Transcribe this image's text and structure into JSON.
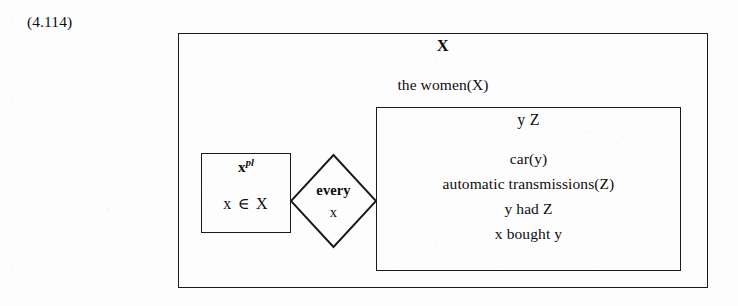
{
  "figure": {
    "equation_label": "(4.114)",
    "type": "discourse-representation-structure"
  },
  "outer_box": {
    "universe": "X",
    "condition": "the women(X)"
  },
  "antecedent_box": {
    "universe_base": "x",
    "universe_superscript": "pl",
    "condition": "x ∈ X"
  },
  "quantifier_diamond": {
    "quantifier": "every",
    "variable": "x"
  },
  "consequent_box": {
    "universe": "y  Z",
    "conditions": [
      "car(y)",
      "automatic transmissions(Z)",
      "y had Z",
      "x bought y"
    ]
  },
  "colors": {
    "ink": "#1a1a1a",
    "page": "#fdfdfd"
  }
}
